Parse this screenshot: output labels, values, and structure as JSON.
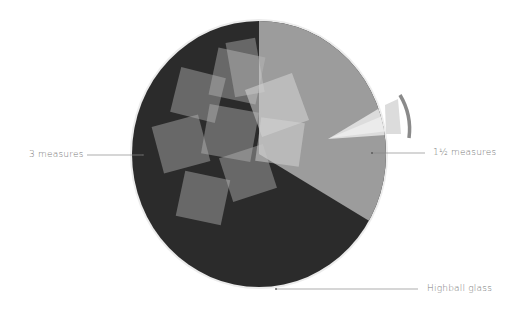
{
  "diagram": {
    "type": "cocktail-glass-diagram",
    "glass": {
      "name": "Highball glass",
      "shape": "circle",
      "rim_color": "#e6e6e6"
    },
    "layers": [
      {
        "label": "3 measures",
        "color": "#2b2b2b",
        "share_degrees": 239
      },
      {
        "label": "1½ measures",
        "color": "#9c9c9c",
        "share_degrees": 121
      }
    ],
    "garnish": {
      "name": "straw",
      "color": "#d9d9d9",
      "accent_color": "#8a8a8a"
    },
    "ice": {
      "count": 9,
      "color": "#bdbdbd"
    }
  },
  "labels": {
    "left": "3 measures",
    "right": "1½ measures",
    "bottom": "Highball glass"
  },
  "colors": {
    "dark_layer": "#2b2b2b",
    "light_layer": "#9c9c9c",
    "leader_line": "#8a8a8a",
    "text": "#7a7a7a"
  }
}
